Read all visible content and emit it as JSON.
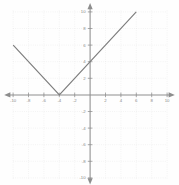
{
  "chart_data": {
    "type": "line",
    "title": "",
    "subtitle": "",
    "xlabel": "",
    "ylabel": "",
    "xlim": [
      -10,
      10
    ],
    "ylim": [
      -10,
      10
    ],
    "grid": true,
    "legend": "none",
    "function_expression": "y = |x + 4|",
    "vertex": [
      -4,
      0
    ],
    "y_intercept": 4,
    "x_ticks": [
      -10,
      -8,
      -6,
      -4,
      -2,
      2,
      4,
      6,
      8,
      10
    ],
    "y_ticks": [
      10,
      8,
      6,
      4,
      2,
      -2,
      -4,
      -6,
      -8,
      -10
    ],
    "x_tick_labels": [
      "-10",
      "-8",
      "-6",
      "-4",
      "-2",
      "2",
      "4",
      "6",
      "8",
      "10"
    ],
    "y_tick_labels": [
      "10",
      "8",
      "6",
      "4",
      "2",
      "-2",
      "-4",
      "-6",
      "-8",
      "-10"
    ],
    "series": [
      {
        "name": "absolute-value",
        "x": [
          -10,
          -4,
          6
        ],
        "values": [
          6,
          0,
          10
        ]
      }
    ],
    "colors": {
      "curve": "#7d7d7d",
      "axis": "#8d8d8d",
      "grid": "#dedede",
      "label": "#8a8a8a",
      "background": "#fefefe"
    }
  },
  "axes": {
    "x_axis_name": "x-axis",
    "y_axis_name": "y-axis",
    "arrow_ends": [
      "left",
      "right",
      "top",
      "bottom"
    ]
  }
}
